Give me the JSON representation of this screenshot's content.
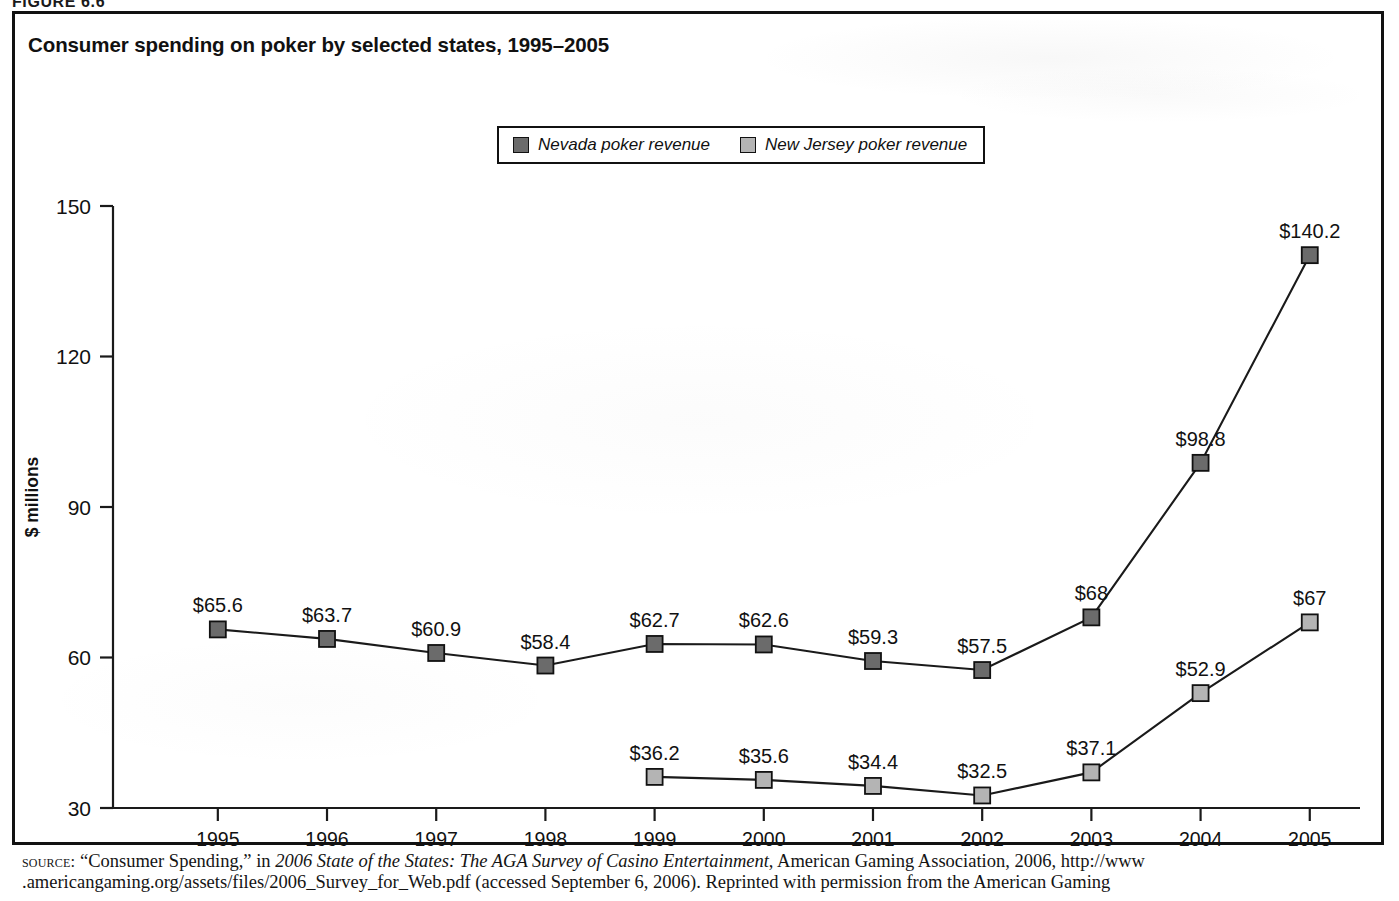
{
  "figure": {
    "caption": "FIGURE 6.6",
    "title": "Consumer spending on poker by selected states, 1995–2005"
  },
  "legend": {
    "items": [
      {
        "label": "Nevada poker revenue",
        "color": "#6b6b6b",
        "key": "nevada"
      },
      {
        "label": "New Jersey poker revenue",
        "color": "#b4b4b4",
        "key": "new_jersey"
      }
    ]
  },
  "axes": {
    "y_title": "$ millions",
    "y_ticks": [
      "30",
      "60",
      "90",
      "120",
      "150"
    ],
    "x_ticks": [
      "1995",
      "1996",
      "1997",
      "1998",
      "1999",
      "2000",
      "2001",
      "2002",
      "2003",
      "2004",
      "2005"
    ]
  },
  "source": {
    "keyword": "source:",
    "line1_a": "“Consumer Spending,” in ",
    "line1_italic": "2006 State of the States: The AGA Survey of Casino Entertainment",
    "line1_b": ", American Gaming Association, 2006, http://www",
    "line2": ".americangaming.org/assets/files/2006_Survey_for_Web.pdf (accessed September 6, 2006). Reprinted with permission from the American Gaming"
  },
  "chart_data": {
    "type": "line",
    "title": "Consumer spending on poker by selected states, 1995–2005",
    "xlabel": "",
    "ylabel": "$ millions",
    "ylim": [
      30,
      150
    ],
    "yticks": [
      30,
      60,
      90,
      120,
      150
    ],
    "grid": false,
    "legend_position": "top-center",
    "x": [
      1995,
      1996,
      1997,
      1998,
      1999,
      2000,
      2001,
      2002,
      2003,
      2004,
      2005
    ],
    "categories": [
      "1995",
      "1996",
      "1997",
      "1998",
      "1999",
      "2000",
      "2001",
      "2002",
      "2003",
      "2004",
      "2005"
    ],
    "series": [
      {
        "name": "Nevada poker revenue",
        "color": "#6b6b6b",
        "values": [
          65.6,
          63.7,
          60.9,
          58.4,
          62.7,
          62.6,
          59.3,
          57.5,
          68,
          98.8,
          140.2
        ],
        "labels": [
          "$65.6",
          "$63.7",
          "$60.9",
          "$58.4",
          "$62.7",
          "$62.6",
          "$59.3",
          "$57.5",
          "$68",
          "$98.8",
          "$140.2"
        ]
      },
      {
        "name": "New Jersey poker revenue",
        "color": "#b4b4b4",
        "values": [
          null,
          null,
          null,
          null,
          36.2,
          35.6,
          34.4,
          32.5,
          37.1,
          52.9,
          67
        ],
        "labels": [
          null,
          null,
          null,
          null,
          "$36.2",
          "$35.6",
          "$34.4",
          "$32.5",
          "$37.1",
          "$52.9",
          "$67"
        ]
      }
    ]
  }
}
